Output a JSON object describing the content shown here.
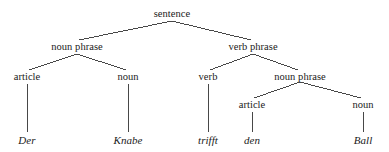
{
  "figure": {
    "type": "syntax-tree",
    "language": "German",
    "sentence_text": "Der Knabe trifft den Ball",
    "line_color": "#333333",
    "text_color": "#1a1a1a",
    "background": "#ffffff"
  },
  "nodes": [
    {
      "id": "s",
      "label": "sentence",
      "x": 172,
      "y": 14,
      "level": 0,
      "terminal": false
    },
    {
      "id": "np1",
      "label": "noun phrase",
      "x": 77,
      "y": 47,
      "level": 1,
      "terminal": false
    },
    {
      "id": "vp",
      "label": "verb phrase",
      "x": 253,
      "y": 47,
      "level": 1,
      "terminal": false
    },
    {
      "id": "art1",
      "label": "article",
      "x": 27,
      "y": 77,
      "level": 2,
      "terminal": false
    },
    {
      "id": "n1",
      "label": "noun",
      "x": 128,
      "y": 77,
      "level": 2,
      "terminal": false
    },
    {
      "id": "v",
      "label": "verb",
      "x": 208,
      "y": 77,
      "level": 2,
      "terminal": false
    },
    {
      "id": "np2",
      "label": "noun phrase",
      "x": 300,
      "y": 77,
      "level": 2,
      "terminal": false
    },
    {
      "id": "art2",
      "label": "article",
      "x": 252,
      "y": 105,
      "level": 3,
      "terminal": false
    },
    {
      "id": "n2",
      "label": "noun",
      "x": 363,
      "y": 105,
      "level": 3,
      "terminal": false
    },
    {
      "id": "w-der",
      "label": "Der",
      "x": 27,
      "y": 140,
      "level": 4,
      "terminal": true
    },
    {
      "id": "w-knabe",
      "label": "Knabe",
      "x": 128,
      "y": 140,
      "level": 4,
      "terminal": true
    },
    {
      "id": "w-trifft",
      "label": "trifft",
      "x": 208,
      "y": 140,
      "level": 4,
      "terminal": true
    },
    {
      "id": "w-den",
      "label": "den",
      "x": 252,
      "y": 140,
      "level": 4,
      "terminal": true
    },
    {
      "id": "w-ball",
      "label": "Ball",
      "x": 363,
      "y": 140,
      "level": 4,
      "terminal": true
    }
  ],
  "edges": [
    {
      "from": "s",
      "to": "np1",
      "x1": 172,
      "y1": 21,
      "x2": 79,
      "y2": 40
    },
    {
      "from": "s",
      "to": "vp",
      "x1": 172,
      "y1": 21,
      "x2": 251,
      "y2": 40
    },
    {
      "from": "np1",
      "to": "art1",
      "x1": 77,
      "y1": 54,
      "x2": 29,
      "y2": 70
    },
    {
      "from": "np1",
      "to": "n1",
      "x1": 77,
      "y1": 54,
      "x2": 126,
      "y2": 70
    },
    {
      "from": "vp",
      "to": "v",
      "x1": 253,
      "y1": 54,
      "x2": 210,
      "y2": 70
    },
    {
      "from": "vp",
      "to": "np2",
      "x1": 253,
      "y1": 54,
      "x2": 298,
      "y2": 70
    },
    {
      "from": "np2",
      "to": "art2",
      "x1": 300,
      "y1": 82,
      "x2": 254,
      "y2": 98
    },
    {
      "from": "np2",
      "to": "n2",
      "x1": 300,
      "y1": 82,
      "x2": 361,
      "y2": 98
    },
    {
      "from": "art1",
      "to": "w-der",
      "x1": 27,
      "y1": 84,
      "x2": 27,
      "y2": 132
    },
    {
      "from": "n1",
      "to": "w-knabe",
      "x1": 128,
      "y1": 84,
      "x2": 128,
      "y2": 132
    },
    {
      "from": "v",
      "to": "w-trifft",
      "x1": 208,
      "y1": 84,
      "x2": 208,
      "y2": 132
    },
    {
      "from": "art2",
      "to": "w-den",
      "x1": 252,
      "y1": 112,
      "x2": 252,
      "y2": 132
    },
    {
      "from": "n2",
      "to": "w-ball",
      "x1": 363,
      "y1": 112,
      "x2": 363,
      "y2": 132
    }
  ]
}
